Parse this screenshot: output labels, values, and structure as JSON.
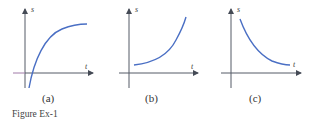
{
  "figure": {
    "caption": "Figure Ex-1",
    "panels": [
      {
        "id": "a",
        "label": "(a)",
        "y_axis_label": "s",
        "x_axis_label": "t",
        "description": "increasing, concave down, starting below t-axis"
      },
      {
        "id": "b",
        "label": "(b)",
        "y_axis_label": "s",
        "x_axis_label": "t",
        "description": "increasing, concave up, starting above t-axis"
      },
      {
        "id": "c",
        "label": "(c)",
        "y_axis_label": "s",
        "x_axis_label": "t",
        "description": "decreasing, concave up, approaching t-axis"
      }
    ]
  },
  "colors": {
    "curve": "#4a6fc4",
    "axis": "#555a66"
  }
}
